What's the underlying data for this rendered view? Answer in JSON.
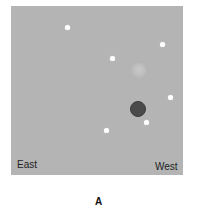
{
  "panel": {
    "background": "#b4b4b4",
    "labels": {
      "left": "East",
      "right": "West"
    },
    "stars": [
      {
        "x": 67,
        "y": 27
      },
      {
        "x": 162,
        "y": 44
      },
      {
        "x": 112,
        "y": 58
      },
      {
        "x": 170,
        "y": 97
      },
      {
        "x": 146,
        "y": 122
      },
      {
        "x": 106,
        "y": 130
      }
    ],
    "bodies": [
      {
        "name": "light-body",
        "x": 138,
        "y": 70,
        "color": "#c2c2c2"
      },
      {
        "name": "dark-body",
        "x": 138,
        "y": 109,
        "color": "#4a4a4a"
      }
    ]
  },
  "caption": "A"
}
